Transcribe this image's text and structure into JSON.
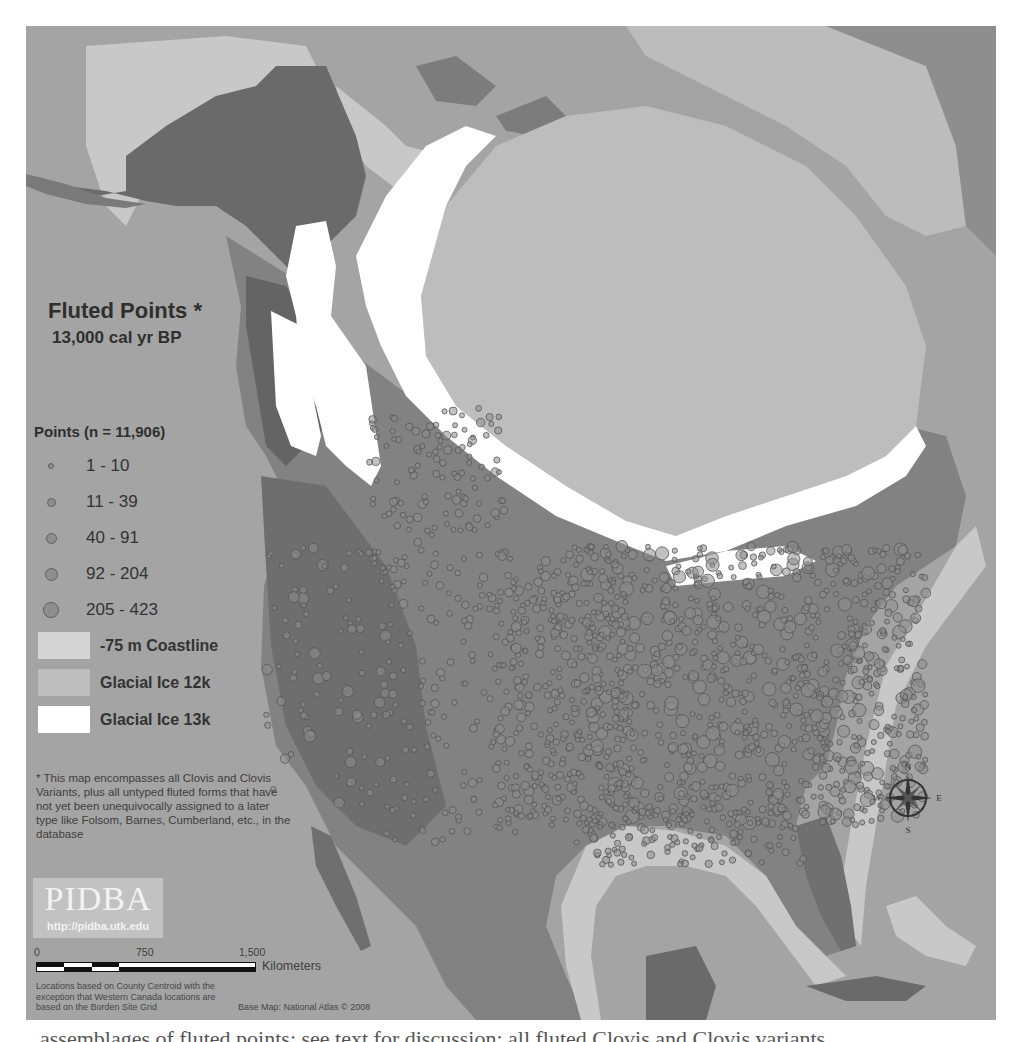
{
  "map": {
    "title": "Fluted Points *",
    "subtitle": "13,000 cal yr BP",
    "colors": {
      "ocean": "#a4a4a4",
      "land_north": "#6c6c6c",
      "land_plains": "#8a8a8a",
      "land_east": "#7a7a7a",
      "shelf_coastline": "#cacaca",
      "glacial_ice_12k": "#bcbcbc",
      "glacial_ice_13k": "#ffffff",
      "point_fill": "#8e8e8e",
      "point_stroke": "#555555"
    },
    "legend": {
      "points_title": "Points (n = 11,906)",
      "point_classes": [
        {
          "label": "1 - 10",
          "size": 6
        },
        {
          "label": "11 - 39",
          "size": 9
        },
        {
          "label": "40 - 91",
          "size": 11
        },
        {
          "label": "92 - 204",
          "size": 13
        },
        {
          "label": "205 - 423",
          "size": 16
        }
      ],
      "areas": [
        {
          "label": "-75 m Coastline",
          "color": "#d4d4d4"
        },
        {
          "label": "Glacial Ice 12k",
          "color": "#bdbdbd"
        },
        {
          "label": "Glacial Ice 13k",
          "color": "#ffffff"
        }
      ]
    },
    "footnote": "* This map encompasses all Clovis and Clovis Variants, plus all untyped fluted forms that have not yet been unequivocally assigned to a later type like Folsom, Barnes, Cumberland, etc., in the database",
    "logo": {
      "name": "PIDBA",
      "url": "http://pidba.utk.edu"
    },
    "scale_bar": {
      "ticks": [
        "0",
        "750",
        "1,500"
      ],
      "unit": "Kilometers"
    },
    "location_note": "Locations based on County Centroid with the exception that Western Canada locations are based on the Borden Site Grid",
    "base_map_credit": "Base Map: National Atlas © 2008",
    "compass": {
      "n": "N",
      "s": "S",
      "e": "E",
      "w": "W"
    }
  },
  "page": {
    "caption_fragment": "assemblages of fluted points; see text for discussion; all fluted Clovis and Clovis variants"
  }
}
